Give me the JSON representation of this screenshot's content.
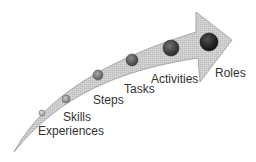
{
  "diagram": {
    "type": "progression-arrow",
    "colors": {
      "arrow_fill": "#c9c9c9",
      "arrow_stroke": "#9a9a9a",
      "text": "#333333",
      "dot_dark": "#1a1a1a",
      "dot_light": "#8a8a8a"
    },
    "stages": [
      {
        "label": "Experiences",
        "order": 1
      },
      {
        "label": "Skills",
        "order": 2
      },
      {
        "label": "Steps",
        "order": 3
      },
      {
        "label": "Tasks",
        "order": 4
      },
      {
        "label": "Activities",
        "order": 5
      },
      {
        "label": "Roles",
        "order": 6
      }
    ]
  }
}
